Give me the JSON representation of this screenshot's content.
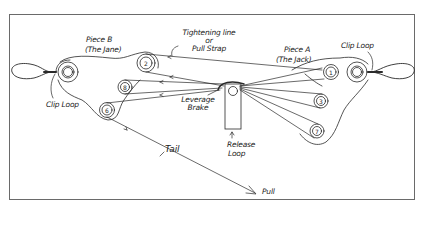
{
  "diagram": {
    "colors": {
      "ink": "#2a2a2a",
      "frame": "#6a6a6a",
      "background": "#ffffff"
    },
    "labels": {
      "piece_b": "Piece B",
      "piece_b_sub": "(The Jane)",
      "piece_a": "Piece A",
      "piece_a_sub": "(The Jack)",
      "tightening_line_1": "Tightening line",
      "tightening_line_2": "or",
      "tightening_line_3": "Pull Strap",
      "clip_loop_left": "Clip Loop",
      "clip_loop_right": "Clip Loop",
      "leverage_brake_1": "Leverage",
      "leverage_brake_2": "Brake",
      "release_loop_1": "Release",
      "release_loop_2": "Loop",
      "tail": "Tail",
      "pull": "Pull"
    },
    "pulleys": [
      {
        "id": "2",
        "piece": "B",
        "label": "2"
      },
      {
        "id": "8",
        "piece": "B",
        "label": "8"
      },
      {
        "id": "6",
        "piece": "B",
        "label": "6"
      },
      {
        "id": "1",
        "piece": "A",
        "label": "1"
      },
      {
        "id": "3",
        "piece": "A",
        "label": "3"
      },
      {
        "id": "7",
        "piece": "A",
        "label": "7"
      }
    ],
    "pulley_labels": {
      "p1": "1",
      "p2": "2",
      "p3": "3",
      "p6": "6",
      "p7": "7",
      "p8": "8"
    }
  }
}
